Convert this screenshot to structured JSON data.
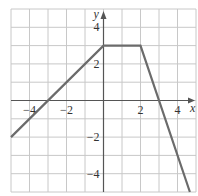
{
  "chart_data": {
    "type": "line",
    "title": "",
    "xlabel": "x",
    "ylabel": "y",
    "xlim": [
      -5,
      5
    ],
    "ylim": [
      -5,
      5
    ],
    "grid": true,
    "x_ticks": [
      -4,
      -2,
      2,
      4
    ],
    "y_ticks": [
      4,
      2,
      -2,
      -4
    ],
    "x_tick_labels": [
      "−4",
      "−2",
      "2",
      "4"
    ],
    "y_tick_labels": [
      "4",
      "2",
      "−2",
      "−4"
    ],
    "series": [
      {
        "name": "piecewise",
        "x": [
          -5,
          0,
          2,
          4.67
        ],
        "y": [
          -2,
          3,
          3,
          -5
        ],
        "color": "#6b6b6b"
      }
    ],
    "legend": null
  },
  "colors": {
    "grid": "#c8c8c8",
    "axis": "#555555",
    "line": "#6b6b6b"
  }
}
